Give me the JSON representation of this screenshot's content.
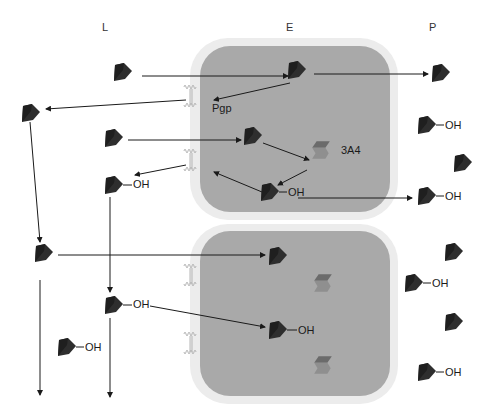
{
  "diagram": {
    "type": "drug transport and metabolism across enterocytes",
    "columns": [
      {
        "id": "L",
        "label": "L",
        "meaning": "lumen"
      },
      {
        "id": "E",
        "label": "E",
        "meaning": "enterocyte"
      },
      {
        "id": "P",
        "label": "P",
        "meaning": "portal blood"
      }
    ],
    "labels": {
      "transporter": "Pgp",
      "enzyme": "3A4",
      "metabolite_group": "OH"
    },
    "cells": [
      {
        "id": "cell-top",
        "contains": [
          "drug",
          "Pgp",
          "drug",
          "3A4",
          "drug-OH"
        ]
      },
      {
        "id": "cell-bottom",
        "contains": [
          "drug",
          "3A4",
          "drug-OH",
          "3A4"
        ]
      }
    ],
    "lumen_molecules": [
      {
        "type": "drug",
        "x": 125,
        "y": 73
      },
      {
        "type": "drug",
        "x": 30,
        "y": 113
      },
      {
        "type": "drug",
        "x": 115,
        "y": 138
      },
      {
        "type": "drug-OH",
        "x": 115,
        "y": 185
      },
      {
        "type": "drug",
        "x": 42,
        "y": 255
      },
      {
        "type": "drug-OH",
        "x": 115,
        "y": 305
      },
      {
        "type": "drug-OH",
        "x": 67,
        "y": 347
      }
    ],
    "cell_molecules": [
      {
        "type": "drug",
        "x": 298,
        "y": 70
      },
      {
        "type": "drug",
        "x": 253,
        "y": 136
      },
      {
        "type": "drug-OH",
        "x": 270,
        "y": 192
      },
      {
        "type": "drug",
        "x": 275,
        "y": 256
      },
      {
        "type": "drug-OH",
        "x": 275,
        "y": 330
      }
    ],
    "enzymes": [
      {
        "x": 320,
        "y": 150,
        "label": "3A4"
      },
      {
        "x": 322,
        "y": 283
      },
      {
        "x": 322,
        "y": 365
      }
    ],
    "portal_molecules": [
      {
        "type": "drug",
        "x": 440,
        "y": 73
      },
      {
        "type": "drug-OH",
        "x": 426,
        "y": 125
      },
      {
        "type": "drug",
        "x": 462,
        "y": 163
      },
      {
        "type": "drug-OH",
        "x": 426,
        "y": 195
      },
      {
        "type": "drug",
        "x": 453,
        "y": 252
      },
      {
        "type": "drug-OH",
        "x": 413,
        "y": 283
      },
      {
        "type": "drug",
        "x": 453,
        "y": 322
      },
      {
        "type": "drug-OH",
        "x": 426,
        "y": 372
      }
    ],
    "colors": {
      "cell_body": "#a9a9a9",
      "cell_halo": "#ececec",
      "molecule": "#2e2e2e",
      "enzyme_top": "#6b6b6b",
      "enzyme_side": "#8f8f8f",
      "arrow": "#1a1a1a",
      "membrane_protein": "#b5b5b5"
    }
  }
}
